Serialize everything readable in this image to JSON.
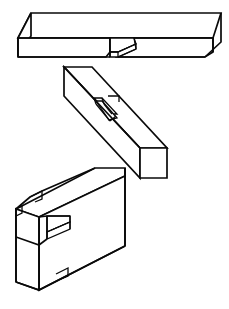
{
  "figure": {
    "title": "Exploded isometric joinery drawing",
    "background_color": "#ffffff",
    "line_color": "#0a0a0a",
    "fill_color": "#ffffff",
    "style": "isometric-line-art",
    "parts": [
      {
        "id": "part-top-bar",
        "label": "Long bar with sloped tenon notch",
        "position": "top",
        "notch_type": "sloped-tenon"
      },
      {
        "id": "part-middle-bar",
        "label": "Angled bar with narrow mortise slot",
        "position": "middle",
        "notch_type": "narrow-mortise-slot"
      },
      {
        "id": "part-bottom-block",
        "label": "Rectangular block with open mortise pocket",
        "position": "bottom",
        "notch_type": "open-mortise-pocket"
      }
    ]
  }
}
